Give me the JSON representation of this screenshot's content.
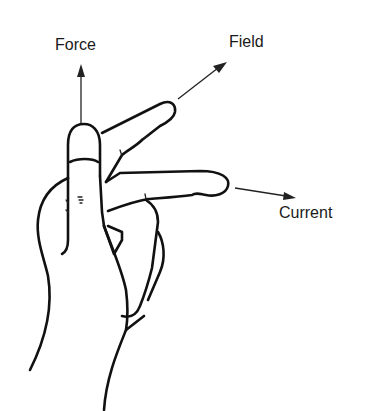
{
  "diagram": {
    "labels": {
      "force": "Force",
      "field": "Field",
      "current": "Current"
    },
    "arrows": [
      {
        "name": "force-arrow",
        "direction": "up",
        "label": "Force"
      },
      {
        "name": "field-arrow",
        "direction": "up-right",
        "label": "Field"
      },
      {
        "name": "current-arrow",
        "direction": "right",
        "label": "Current"
      }
    ],
    "colors": {
      "background": "#ffffff",
      "ink": "#111111"
    }
  }
}
